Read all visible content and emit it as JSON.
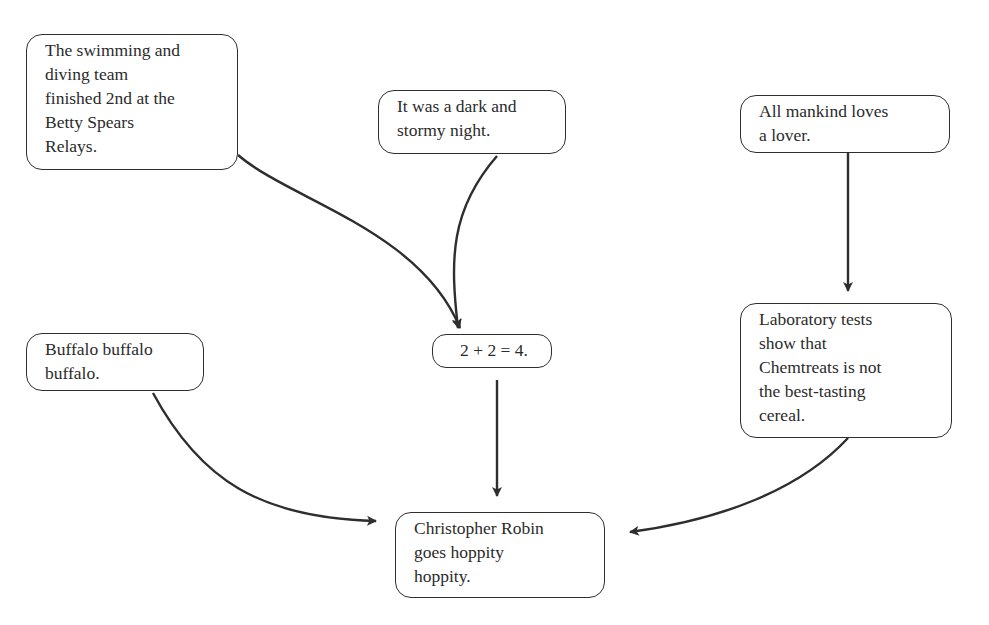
{
  "diagram": {
    "type": "directed-graph",
    "nodes": [
      {
        "id": "swimming",
        "lines": [
          "The swimming and",
          "diving team",
          "finished 2nd at the",
          "Betty Spears",
          "Relays."
        ]
      },
      {
        "id": "dark-night",
        "lines": [
          "It was a dark and",
          "stormy night."
        ]
      },
      {
        "id": "mankind",
        "lines": [
          "All mankind loves",
          "a lover."
        ]
      },
      {
        "id": "buffalo",
        "lines": [
          "Buffalo buffalo",
          "buffalo."
        ]
      },
      {
        "id": "math",
        "lines": [
          "2 + 2 = 4."
        ]
      },
      {
        "id": "lab-tests",
        "lines": [
          "Laboratory tests",
          "show that",
          "Chemtreats is not",
          "the best-tasting",
          "cereal."
        ]
      },
      {
        "id": "christopher",
        "lines": [
          "Christopher Robin",
          "goes hoppity",
          "hoppity."
        ]
      }
    ],
    "edges": [
      {
        "from": "swimming",
        "to": "math"
      },
      {
        "from": "dark-night",
        "to": "math"
      },
      {
        "from": "mankind",
        "to": "lab-tests"
      },
      {
        "from": "math",
        "to": "christopher"
      },
      {
        "from": "buffalo",
        "to": "christopher"
      },
      {
        "from": "lab-tests",
        "to": "christopher"
      }
    ],
    "colors": {
      "stroke": "#2e2e2e",
      "text": "#2b2b2b",
      "background": "#ffffff"
    }
  }
}
